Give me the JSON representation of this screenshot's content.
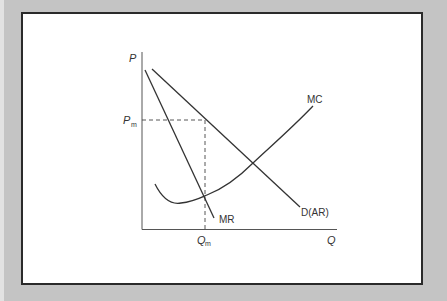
{
  "diagram": {
    "type": "monopoly-price-output",
    "axes": {
      "y_label": "P",
      "x_label": "Q"
    },
    "curves": [
      {
        "id": "mr",
        "label": "MR",
        "kind": "line"
      },
      {
        "id": "d",
        "label": "D(AR)",
        "kind": "line"
      },
      {
        "id": "mc",
        "label": "MC",
        "kind": "curve"
      }
    ],
    "markers": {
      "price": {
        "symbol": "P",
        "subscript": "m"
      },
      "quantity": {
        "symbol": "Q",
        "subscript": "m"
      }
    },
    "colors": {
      "background": "#c4c4c4",
      "panel": "#ffffff",
      "line": "#333333",
      "border": "#2a2a2a"
    }
  }
}
